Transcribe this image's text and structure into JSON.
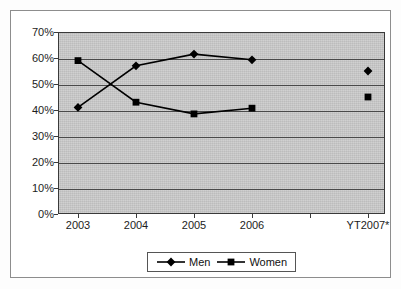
{
  "chart_data": {
    "type": "line",
    "title": "",
    "subtitle": "",
    "xlabel": "",
    "ylabel": "",
    "categories": [
      "2003",
      "2004",
      "2005",
      "2006",
      "YT2007*"
    ],
    "series": [
      {
        "name": "Men",
        "marker": "diamond",
        "color": "#000000",
        "values": [
          41.0,
          57.0,
          61.5,
          59.3,
          55.0
        ],
        "connected_through_index": 3,
        "last_point_disconnected": true
      },
      {
        "name": "Women",
        "marker": "square",
        "color": "#000000",
        "values": [
          59.0,
          43.0,
          38.5,
          40.7,
          45.0
        ],
        "connected_through_index": 3,
        "last_point_disconnected": true
      }
    ],
    "ylim": [
      0,
      70
    ],
    "ytick_values": [
      0,
      10,
      20,
      30,
      40,
      50,
      60,
      70
    ],
    "ytick_labels": [
      "0%",
      "10%",
      "20%",
      "30%",
      "40%",
      "50%",
      "60%",
      "70%"
    ],
    "grid": true,
    "grid_axis": "y",
    "legend_position": "bottom",
    "plot_background": "#c9c9c9",
    "figure_background": "#ffffff",
    "border_color": "#3a3a3a"
  },
  "legend": {
    "entries": [
      {
        "label": "Men",
        "marker": "diamond"
      },
      {
        "label": "Women",
        "marker": "square"
      }
    ]
  },
  "axes": {
    "y_labels": [
      "70%",
      "60%",
      "50%",
      "40%",
      "30%",
      "20%",
      "10%",
      "0%"
    ],
    "x_labels": [
      "2003",
      "2004",
      "2005",
      "2006",
      "YT2007*"
    ]
  }
}
